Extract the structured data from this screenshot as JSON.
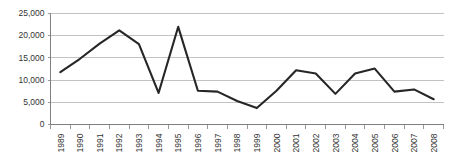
{
  "chart_data": {
    "type": "line",
    "title": "",
    "subtitle": "",
    "xlabel": "",
    "ylabel": "",
    "grid": true,
    "legend": false,
    "legend_position": "none",
    "line_color": "#262626",
    "gridline_color": "#b3b3b3",
    "axis_color": "#808080",
    "background_color": "#ffffff",
    "categories": [
      "1989",
      "1990",
      "1991",
      "1992",
      "1993",
      "1994",
      "1995",
      "1996",
      "1997",
      "1998",
      "1999",
      "2000",
      "2001",
      "2002",
      "2003",
      "2004",
      "2005",
      "2006",
      "2007",
      "2008"
    ],
    "values": [
      11800,
      14800,
      18200,
      21200,
      18100,
      7100,
      22000,
      7600,
      7400,
      5300,
      3700,
      7600,
      12200,
      11500,
      6900,
      11500,
      12600,
      7400,
      7900,
      5700
    ],
    "ylim": [
      0,
      25000
    ],
    "ytick_values": [
      0,
      5000,
      10000,
      15000,
      20000,
      25000
    ],
    "ytick_labels": [
      "0",
      "5,000",
      "10,000",
      "15,000",
      "20,000",
      "25,000"
    ],
    "xtick_labels": [
      "1989",
      "1990",
      "1991",
      "1992",
      "1993",
      "1994",
      "1995",
      "1996",
      "1997",
      "1998",
      "1999",
      "2000",
      "2001",
      "2002",
      "2003",
      "2004",
      "2005",
      "2006",
      "2007",
      "2008"
    ],
    "xtick_rotation": 90,
    "annotations": []
  }
}
